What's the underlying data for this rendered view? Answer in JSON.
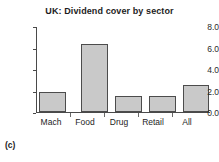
{
  "caption": "(c)",
  "chart_data": {
    "type": "bar",
    "title": "UK: Dividend cover by sector",
    "xlabel": "",
    "ylabel": "",
    "categories": [
      "Mach",
      "Food",
      "Drug",
      "Retail",
      "All"
    ],
    "values": [
      1.9,
      6.4,
      1.5,
      1.5,
      2.5
    ],
    "ylim": [
      0.0,
      8.0
    ],
    "ytick_values": [
      0.0,
      2.0,
      4.0,
      6.0,
      8.0
    ],
    "ytick_labels": [
      "0.0",
      "2.0",
      "4.0",
      "6.0",
      "8.0"
    ],
    "grid": true,
    "grid_axis": "y",
    "legend": false,
    "legend_position": "none",
    "bar_fill_color": "#c9c9c9",
    "bar_edge_color": "#4c4c4c",
    "gridline_color": "#b0b0b0",
    "axis_color": "#4a4a4a",
    "background_color": "#ffffff"
  }
}
